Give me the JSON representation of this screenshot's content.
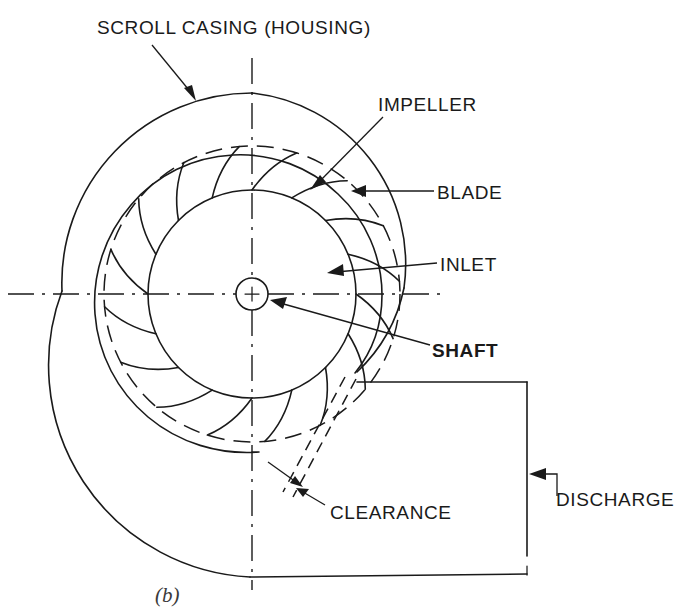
{
  "figure": {
    "caption": "(b)",
    "ink_color": "#1a1a1a",
    "background_color": "#ffffff"
  },
  "labels": {
    "scroll_casing": "SCROLL CASING (HOUSING)",
    "impeller": "IMPELLER",
    "blade": "BLADE",
    "inlet": "INLET",
    "shaft": "SHAFT",
    "clearance": "CLEARANCE",
    "discharge": "DISCHARGE"
  },
  "geometry": {
    "center_x": 252,
    "center_y": 294,
    "shaft_radius": 16,
    "hub_radius": 104,
    "impeller_tip_radius": 148,
    "blade_count": 16,
    "casing_min_radius": 158,
    "casing_max_radius": 232,
    "duct_top_y": 382,
    "duct_bottom_y": 576,
    "duct_right_x": 527
  }
}
